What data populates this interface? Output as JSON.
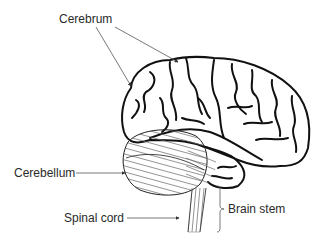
{
  "diagram": {
    "type": "labeled anatomical illustration",
    "labels": {
      "cerebrum": "Cerebrum",
      "cerebellum": "Cerebellum",
      "spinal_cord": "Spinal cord",
      "brain_stem": "Brain stem"
    },
    "colors": {
      "outline": "#111111",
      "leader_line": "#555555",
      "hatch": "#666666",
      "text": "#2a2a2a"
    }
  }
}
